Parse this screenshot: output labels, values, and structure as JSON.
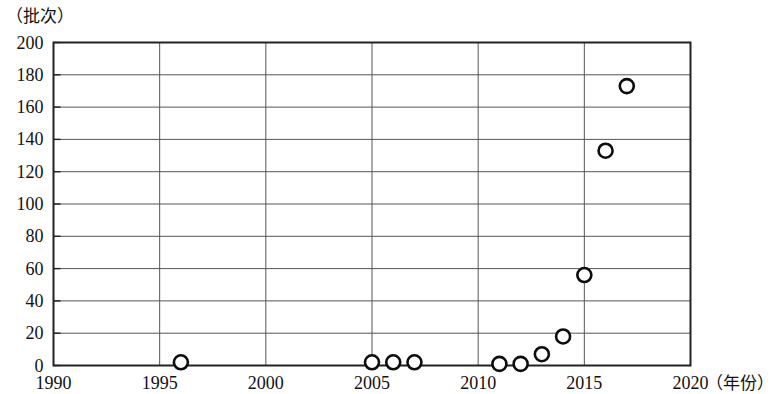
{
  "chart_data": {
    "type": "scatter",
    "title": "",
    "subtitle": "",
    "xlabel": "（年份）",
    "ylabel": "（批次）",
    "ylabel_position": "top-left",
    "xlabel_position": "right-of-axis",
    "xlim": [
      1990,
      2020
    ],
    "ylim": [
      0,
      200
    ],
    "xticks": [
      1990,
      1995,
      2000,
      2005,
      2010,
      2015,
      2020
    ],
    "yticks": [
      0,
      20,
      40,
      60,
      80,
      100,
      120,
      140,
      160,
      180,
      200
    ],
    "xtick_labels": [
      "1990",
      "1995",
      "2000",
      "2005",
      "2010",
      "2015",
      "2020"
    ],
    "ytick_labels": [
      "0",
      "20",
      "40",
      "60",
      "80",
      "100",
      "120",
      "140",
      "160",
      "180",
      "200"
    ],
    "grid": {
      "horizontal": true,
      "vertical": true,
      "color": "#555555"
    },
    "legend": {
      "visible": false,
      "entries": []
    },
    "marker": {
      "shape": "circle-open",
      "fill": "#ffffff",
      "stroke": "#0d0d0d",
      "radius": 7
    },
    "x": [
      1996,
      2005,
      2006,
      2007,
      2011,
      2012,
      2013,
      2014,
      2015,
      2016,
      2017
    ],
    "values": [
      2,
      2,
      2,
      2,
      1,
      1,
      7,
      18,
      56,
      133,
      173
    ],
    "points": [
      {
        "x": 1996,
        "y": 2
      },
      {
        "x": 2005,
        "y": 2
      },
      {
        "x": 2006,
        "y": 2
      },
      {
        "x": 2007,
        "y": 2
      },
      {
        "x": 2011,
        "y": 1
      },
      {
        "x": 2012,
        "y": 1
      },
      {
        "x": 2013,
        "y": 7
      },
      {
        "x": 2014,
        "y": 18
      },
      {
        "x": 2015,
        "y": 56
      },
      {
        "x": 2016,
        "y": 133
      },
      {
        "x": 2017,
        "y": 173
      }
    ],
    "annotations": []
  },
  "colors": {
    "background": "#ffffff",
    "axis": "#222222",
    "grid": "#555555",
    "marker_stroke": "#0d0d0d",
    "marker_fill": "#ffffff",
    "text": "#111111"
  }
}
